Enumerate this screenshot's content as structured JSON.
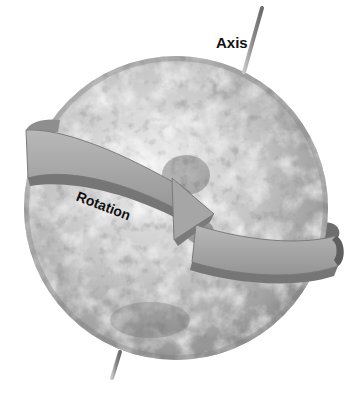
{
  "diagram": {
    "labels": {
      "axis": "Axis",
      "rotation": "Rotation"
    },
    "elements": [
      {
        "id": "globe",
        "kind": "sphere",
        "description": "Grayscale satellite view of Earth with clouds"
      },
      {
        "id": "axis-rod",
        "kind": "line",
        "description": "Tilted rotation axis piercing the north and south poles"
      },
      {
        "id": "rotation-band",
        "kind": "curved-arrow",
        "description": "Band wrapping around the globe, arrowhead pointing in direction of rotation"
      }
    ],
    "colors": {
      "background": "#ffffff",
      "globe_light": "#e6e6e6",
      "globe_mid": "#b4b4b4",
      "globe_dark": "#707070",
      "band_face": "#a9a9a9",
      "band_edge": "#8a8a8a",
      "band_shadow": "#6e6e6e",
      "axis": "#9a9a9a",
      "text": "#111111"
    }
  }
}
